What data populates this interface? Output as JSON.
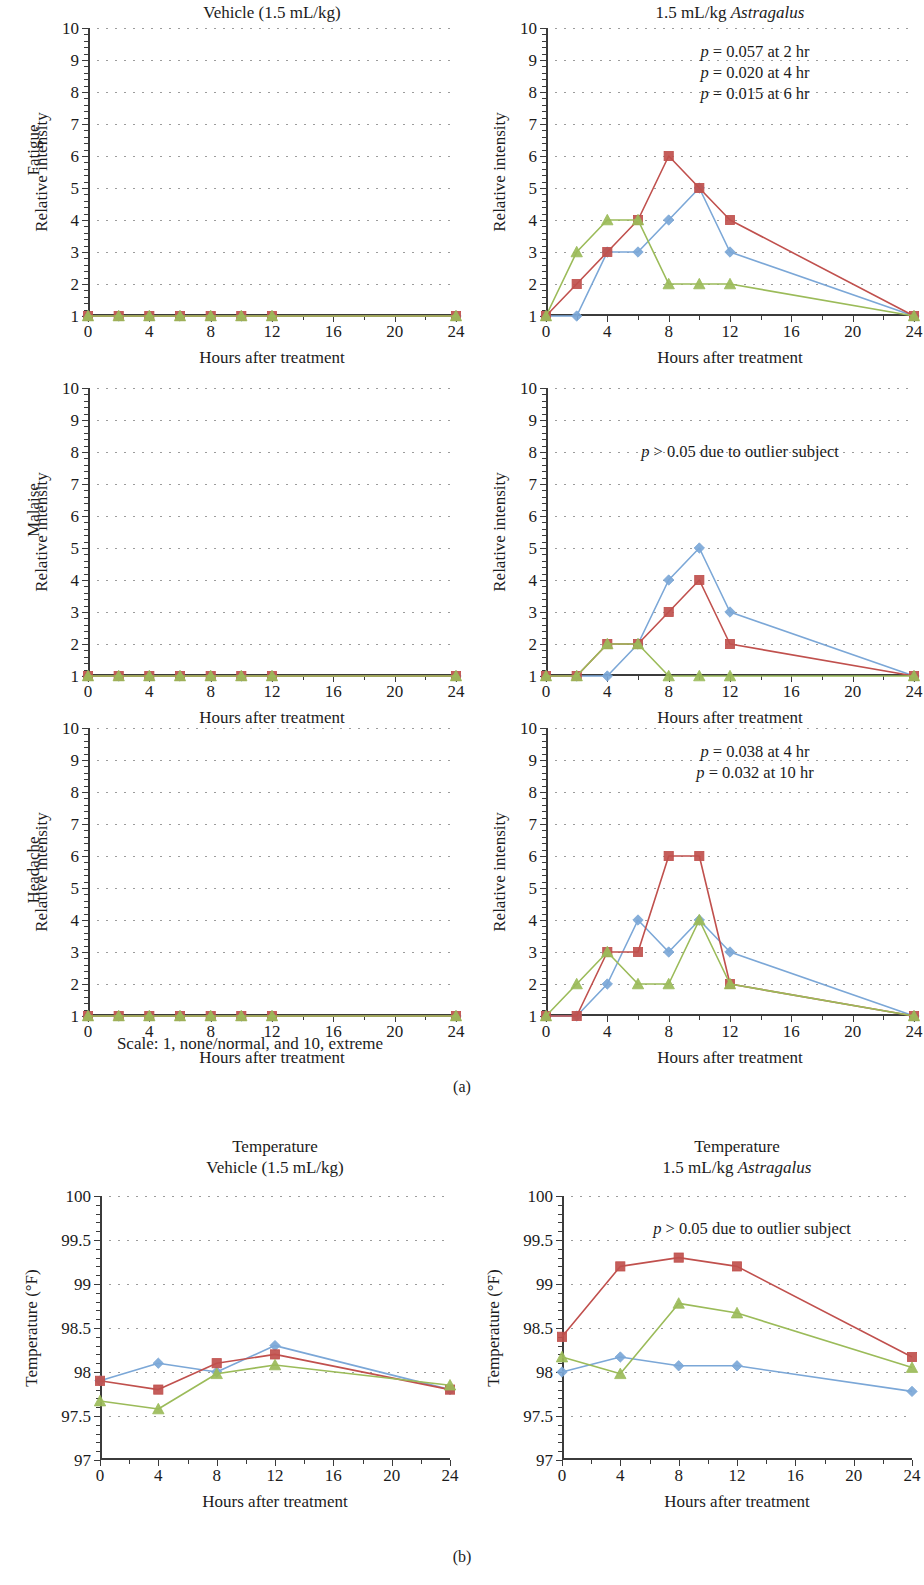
{
  "figure": {
    "panel_a_label": "(a)",
    "panel_b_label": "(b)",
    "scale_note": "Scale: 1, none/normal, and 10, extreme",
    "x_axis_title": "Hours after treatment",
    "y_axis_title_intensity": "Relative intensity",
    "y_axis_title_temperature": "Temperature (°F)",
    "row_labels": {
      "fatigue": "Fatigue",
      "malaise": "Malaise",
      "headache": "Headache"
    },
    "column_titles": {
      "vehicle": "Vehicle (1.5 mL/kg)",
      "astragalus_pre": "1.5 mL/kg ",
      "astragalus_it": "Astragalus",
      "temperature": "Temperature"
    }
  },
  "colors": {
    "series_blue": "#7ba7d7",
    "series_red": "#c0504d",
    "series_green": "#9bbb59",
    "axis": "#3b3b3b",
    "grid": "#8a8a8a",
    "text": "#1b1b1b"
  },
  "chart_data": [
    {
      "id": "fatigue-vehicle",
      "type": "line",
      "title": "Vehicle (1.5 mL/kg)",
      "row_label": "Fatigue",
      "xlabel": "Hours after treatment",
      "ylabel": "Relative intensity",
      "x": [
        0,
        2,
        4,
        6,
        8,
        10,
        12,
        24
      ],
      "xlim": [
        0,
        24
      ],
      "ylim": [
        1,
        10
      ],
      "xticks": [
        0,
        4,
        8,
        12,
        16,
        20,
        24
      ],
      "xticklabels": [
        "0",
        "4",
        "8",
        "12",
        "16",
        "20",
        "24"
      ],
      "yticks": [
        1,
        2,
        3,
        4,
        5,
        6,
        7,
        8,
        9,
        10
      ],
      "yticklabels": [
        "1",
        "2",
        "3",
        "4",
        "5",
        "6",
        "7",
        "8",
        "9",
        "10"
      ],
      "grid": true,
      "annotations": [],
      "series": [
        {
          "name": "subject-blue",
          "marker": "diamond",
          "color": "#7ba7d7",
          "values": [
            1,
            1,
            1,
            1,
            1,
            1,
            1,
            1
          ]
        },
        {
          "name": "subject-red",
          "marker": "square",
          "color": "#c0504d",
          "values": [
            1,
            1,
            1,
            1,
            1,
            1,
            1,
            1
          ]
        },
        {
          "name": "subject-green",
          "marker": "triangle",
          "color": "#9bbb59",
          "values": [
            1,
            1,
            1,
            1,
            1,
            1,
            1,
            1
          ]
        }
      ]
    },
    {
      "id": "fatigue-astragalus",
      "type": "line",
      "title": "1.5 mL/kg Astragalus",
      "row_label": "Fatigue",
      "xlabel": "Hours after treatment",
      "ylabel": "Relative intensity",
      "x": [
        0,
        2,
        4,
        6,
        8,
        10,
        12,
        24
      ],
      "xlim": [
        0,
        24
      ],
      "ylim": [
        1,
        10
      ],
      "xticks": [
        0,
        4,
        8,
        12,
        16,
        20,
        24
      ],
      "xticklabels": [
        "0",
        "4",
        "8",
        "12",
        "16",
        "20",
        "24"
      ],
      "yticks": [
        1,
        2,
        3,
        4,
        5,
        6,
        7,
        8,
        9,
        10
      ],
      "yticklabels": [
        "1",
        "2",
        "3",
        "4",
        "5",
        "6",
        "7",
        "8",
        "9",
        "10"
      ],
      "grid": true,
      "annotations": [
        "p = 0.057 at 2 hr",
        "p = 0.020 at 4 hr",
        "p = 0.015 at 6 hr"
      ],
      "series": [
        {
          "name": "subject-blue",
          "marker": "diamond",
          "color": "#7ba7d7",
          "values": [
            1,
            1,
            3,
            3,
            4,
            5,
            3,
            1
          ]
        },
        {
          "name": "subject-red",
          "marker": "square",
          "color": "#c0504d",
          "values": [
            1,
            2,
            3,
            4,
            6,
            5,
            4,
            1
          ]
        },
        {
          "name": "subject-green",
          "marker": "triangle",
          "color": "#9bbb59",
          "values": [
            1,
            3,
            4,
            4,
            2,
            2,
            2,
            1
          ]
        }
      ]
    },
    {
      "id": "malaise-vehicle",
      "type": "line",
      "title": "",
      "row_label": "Malaise",
      "xlabel": "Hours after treatment",
      "ylabel": "Relative intensity",
      "x": [
        0,
        2,
        4,
        6,
        8,
        10,
        12,
        24
      ],
      "xlim": [
        0,
        24
      ],
      "ylim": [
        1,
        10
      ],
      "xticks": [
        0,
        4,
        8,
        12,
        16,
        20,
        24
      ],
      "xticklabels": [
        "0",
        "4",
        "8",
        "12",
        "16",
        "20",
        "24"
      ],
      "yticks": [
        1,
        2,
        3,
        4,
        5,
        6,
        7,
        8,
        9,
        10
      ],
      "yticklabels": [
        "1",
        "2",
        "3",
        "4",
        "5",
        "6",
        "7",
        "8",
        "9",
        "10"
      ],
      "grid": true,
      "annotations": [],
      "series": [
        {
          "name": "subject-blue",
          "marker": "diamond",
          "color": "#7ba7d7",
          "values": [
            1,
            1,
            1,
            1,
            1,
            1,
            1,
            1
          ]
        },
        {
          "name": "subject-red",
          "marker": "square",
          "color": "#c0504d",
          "values": [
            1,
            1,
            1,
            1,
            1,
            1,
            1,
            1
          ]
        },
        {
          "name": "subject-green",
          "marker": "triangle",
          "color": "#9bbb59",
          "values": [
            1,
            1,
            1,
            1,
            1,
            1,
            1,
            1
          ]
        }
      ]
    },
    {
      "id": "malaise-astragalus",
      "type": "line",
      "title": "",
      "row_label": "Malaise",
      "xlabel": "Hours after treatment",
      "ylabel": "Relative intensity",
      "x": [
        0,
        2,
        4,
        6,
        8,
        10,
        12,
        24
      ],
      "xlim": [
        0,
        24
      ],
      "ylim": [
        1,
        10
      ],
      "xticks": [
        0,
        4,
        8,
        12,
        16,
        20,
        24
      ],
      "xticklabels": [
        "0",
        "4",
        "8",
        "12",
        "16",
        "20",
        "24"
      ],
      "yticks": [
        1,
        2,
        3,
        4,
        5,
        6,
        7,
        8,
        9,
        10
      ],
      "yticklabels": [
        "1",
        "2",
        "3",
        "4",
        "5",
        "6",
        "7",
        "8",
        "9",
        "10"
      ],
      "grid": true,
      "annotations": [
        "p > 0.05 due to outlier subject"
      ],
      "series": [
        {
          "name": "subject-blue",
          "marker": "diamond",
          "color": "#7ba7d7",
          "values": [
            1,
            1,
            1,
            2,
            4,
            5,
            3,
            1
          ]
        },
        {
          "name": "subject-red",
          "marker": "square",
          "color": "#c0504d",
          "values": [
            1,
            1,
            2,
            2,
            3,
            4,
            2,
            1
          ]
        },
        {
          "name": "subject-green",
          "marker": "triangle",
          "color": "#9bbb59",
          "values": [
            1,
            1,
            2,
            2,
            1,
            1,
            1,
            1
          ]
        }
      ]
    },
    {
      "id": "headache-vehicle",
      "type": "line",
      "title": "",
      "row_label": "Headache",
      "xlabel": "Hours after treatment",
      "ylabel": "Relative intensity",
      "x": [
        0,
        2,
        4,
        6,
        8,
        10,
        12,
        24
      ],
      "xlim": [
        0,
        24
      ],
      "ylim": [
        1,
        10
      ],
      "xticks": [
        0,
        4,
        8,
        12,
        16,
        20,
        24
      ],
      "xticklabels": [
        "0",
        "4",
        "8",
        "12",
        "16",
        "20",
        "24"
      ],
      "yticks": [
        1,
        2,
        3,
        4,
        5,
        6,
        7,
        8,
        9,
        10
      ],
      "yticklabels": [
        "1",
        "2",
        "3",
        "4",
        "5",
        "6",
        "7",
        "8",
        "9",
        "10"
      ],
      "grid": true,
      "annotations": [],
      "series": [
        {
          "name": "subject-blue",
          "marker": "diamond",
          "color": "#7ba7d7",
          "values": [
            1,
            1,
            1,
            1,
            1,
            1,
            1,
            1
          ]
        },
        {
          "name": "subject-red",
          "marker": "square",
          "color": "#c0504d",
          "values": [
            1,
            1,
            1,
            1,
            1,
            1,
            1,
            1
          ]
        },
        {
          "name": "subject-green",
          "marker": "triangle",
          "color": "#9bbb59",
          "values": [
            1,
            1,
            1,
            1,
            1,
            1,
            1,
            1
          ]
        }
      ]
    },
    {
      "id": "headache-astragalus",
      "type": "line",
      "title": "",
      "row_label": "Headache",
      "xlabel": "Hours after treatment",
      "ylabel": "Relative intensity",
      "x": [
        0,
        2,
        4,
        6,
        8,
        10,
        12,
        24
      ],
      "xlim": [
        0,
        24
      ],
      "ylim": [
        1,
        10
      ],
      "xticks": [
        0,
        4,
        8,
        12,
        16,
        20,
        24
      ],
      "xticklabels": [
        "0",
        "4",
        "8",
        "12",
        "16",
        "20",
        "24"
      ],
      "yticks": [
        1,
        2,
        3,
        4,
        5,
        6,
        7,
        8,
        9,
        10
      ],
      "yticklabels": [
        "1",
        "2",
        "3",
        "4",
        "5",
        "6",
        "7",
        "8",
        "9",
        "10"
      ],
      "grid": true,
      "annotations": [
        "p = 0.038 at 4 hr",
        "p = 0.032 at 10 hr"
      ],
      "series": [
        {
          "name": "subject-blue",
          "marker": "diamond",
          "color": "#7ba7d7",
          "values": [
            1,
            1,
            2,
            4,
            3,
            4,
            3,
            1
          ]
        },
        {
          "name": "subject-red",
          "marker": "square",
          "color": "#c0504d",
          "values": [
            1,
            1,
            3,
            3,
            6,
            6,
            2,
            1
          ]
        },
        {
          "name": "subject-green",
          "marker": "triangle",
          "color": "#9bbb59",
          "values": [
            1,
            2,
            3,
            2,
            2,
            4,
            2,
            1
          ]
        }
      ]
    },
    {
      "id": "temperature-vehicle",
      "type": "line",
      "title": "Temperature / Vehicle (1.5 mL/kg)",
      "xlabel": "Hours after treatment",
      "ylabel": "Temperature (°F)",
      "x": [
        0,
        4,
        8,
        12,
        24
      ],
      "xlim": [
        0,
        24
      ],
      "ylim": [
        97,
        100
      ],
      "xticks": [
        0,
        4,
        8,
        12,
        16,
        20,
        24
      ],
      "xticklabels": [
        "0",
        "4",
        "8",
        "12",
        "16",
        "20",
        "24"
      ],
      "yticks": [
        97,
        97.5,
        98,
        98.5,
        99,
        99.5,
        100
      ],
      "yticklabels": [
        "97",
        "97.5",
        "98",
        "98.5",
        "99",
        "99.5",
        "100"
      ],
      "grid": true,
      "annotations": [],
      "series": [
        {
          "name": "subject-blue",
          "marker": "diamond",
          "color": "#7ba7d7",
          "values": [
            97.9,
            98.1,
            98.0,
            98.3,
            97.8
          ]
        },
        {
          "name": "subject-red",
          "marker": "square",
          "color": "#c0504d",
          "values": [
            97.9,
            97.8,
            98.1,
            98.2,
            97.8
          ]
        },
        {
          "name": "subject-green",
          "marker": "triangle",
          "color": "#9bbb59",
          "values": [
            97.67,
            97.58,
            97.98,
            98.08,
            97.85
          ]
        }
      ]
    },
    {
      "id": "temperature-astragalus",
      "type": "line",
      "title": "Temperature / 1.5 mL/kg Astragalus",
      "xlabel": "Hours after treatment",
      "ylabel": "Temperature (°F)",
      "x": [
        0,
        4,
        8,
        12,
        24
      ],
      "xlim": [
        0,
        24
      ],
      "ylim": [
        97,
        100
      ],
      "xticks": [
        0,
        4,
        8,
        12,
        16,
        20,
        24
      ],
      "xticklabels": [
        "0",
        "4",
        "8",
        "12",
        "16",
        "20",
        "24"
      ],
      "yticks": [
        97,
        97.5,
        98,
        98.5,
        99,
        99.5,
        100
      ],
      "yticklabels": [
        "97",
        "97.5",
        "98",
        "98.5",
        "99",
        "99.5",
        "100"
      ],
      "grid": true,
      "annotations": [
        "p > 0.05 due to outlier subject"
      ],
      "series": [
        {
          "name": "subject-blue",
          "marker": "diamond",
          "color": "#7ba7d7",
          "values": [
            98.0,
            98.17,
            98.07,
            98.07,
            97.78
          ]
        },
        {
          "name": "subject-red",
          "marker": "square",
          "color": "#c0504d",
          "values": [
            98.4,
            99.2,
            99.3,
            99.2,
            98.17
          ]
        },
        {
          "name": "subject-green",
          "marker": "triangle",
          "color": "#9bbb59",
          "values": [
            98.17,
            97.98,
            98.78,
            98.67,
            98.05
          ]
        }
      ]
    }
  ]
}
